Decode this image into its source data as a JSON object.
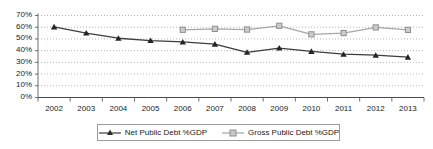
{
  "chart_data": {
    "type": "line",
    "title": "",
    "subtitle": "",
    "xlabel": "",
    "ylabel": "",
    "categories": [
      "2002",
      "2003",
      "2004",
      "2005",
      "2006",
      "2007",
      "2008",
      "2009",
      "2010",
      "2011",
      "2012",
      "2013"
    ],
    "ylim": [
      0,
      70
    ],
    "ytick_labels": [
      "0%",
      "10%",
      "20%",
      "30%",
      "40%",
      "50%",
      "60%",
      "70%"
    ],
    "ytick_values": [
      0,
      10,
      20,
      30,
      40,
      50,
      60,
      70
    ],
    "grid": true,
    "grid_style": "dotted",
    "legend_position": "bottom",
    "series": [
      {
        "name": "Net Public Debt %GDP",
        "color": "#3d3d3d",
        "marker": "triangle",
        "values": [
          60.3,
          55.0,
          50.6,
          48.6,
          47.4,
          45.6,
          38.6,
          42.2,
          39.4,
          37.0,
          36.1,
          34.5
        ]
      },
      {
        "name": "Gross Public Debt %GDP",
        "color": "#a6a6a6",
        "marker": "square",
        "values": [
          null,
          null,
          null,
          null,
          57.8,
          58.6,
          58.0,
          61.2,
          53.9,
          55.0,
          59.8,
          57.7
        ]
      }
    ]
  },
  "legend": {
    "entries": [
      {
        "label": "Net Public Debt %GDP"
      },
      {
        "label": "Gross Public Debt %GDP"
      }
    ]
  }
}
